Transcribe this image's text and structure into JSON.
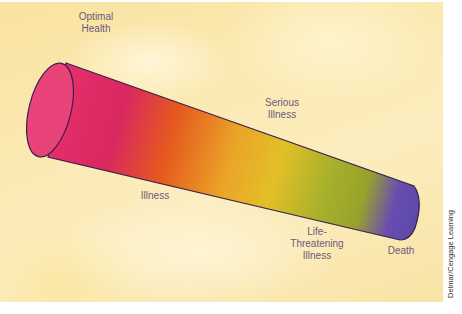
{
  "diagram": {
    "labels": {
      "optimal_health_line1": "Optimal",
      "optimal_health_line2": "Health",
      "serious_illness_line1": "Serious",
      "serious_illness_line2": "Illness",
      "illness": "Illness",
      "life_threatening_line1": "Life-",
      "life_threatening_line2": "Threatening",
      "life_threatening_line3": "Illness",
      "death": "Death"
    },
    "gradient_colors": [
      "#e8306e",
      "#d8285e",
      "#e5571f",
      "#e9a727",
      "#e2c028",
      "#a7b027",
      "#9aa62a",
      "#5f47b0",
      "#5a4aa8"
    ],
    "outline_color": "#3d1f4f"
  },
  "credit": "Delmar/Cengage Learning"
}
